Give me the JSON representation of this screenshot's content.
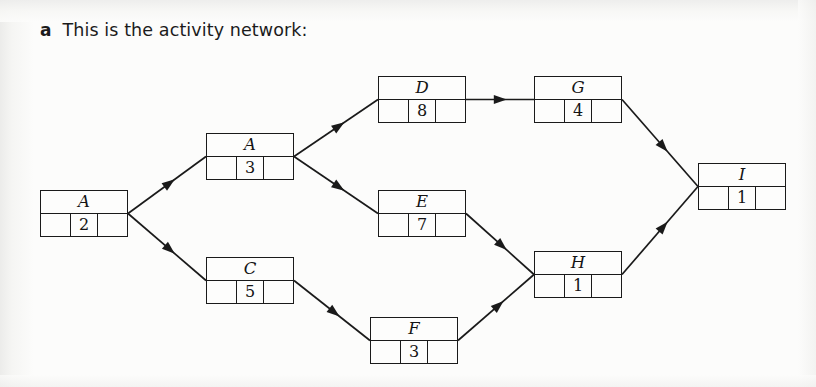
{
  "page": {
    "background_color": "#fcfcfb",
    "ink_color": "#1a1a1a"
  },
  "heading": {
    "marker": "a",
    "text": "This is the activity network:"
  },
  "diagram": {
    "type": "activity-on-node network",
    "box_layout": "top row holds activity letter; bottom row split into three cells with duration in centre cell",
    "nodes": [
      {
        "id": "a1",
        "label": "A",
        "duration": "2",
        "x": 40,
        "y": 190
      },
      {
        "id": "a2",
        "label": "A",
        "duration": "3",
        "x": 206,
        "y": 133
      },
      {
        "id": "c",
        "label": "C",
        "duration": "5",
        "x": 206,
        "y": 257
      },
      {
        "id": "d",
        "label": "D",
        "duration": "8",
        "x": 378,
        "y": 76
      },
      {
        "id": "e",
        "label": "E",
        "duration": "7",
        "x": 378,
        "y": 190
      },
      {
        "id": "f",
        "label": "F",
        "duration": "3",
        "x": 370,
        "y": 317
      },
      {
        "id": "g",
        "label": "G",
        "duration": "4",
        "x": 534,
        "y": 76
      },
      {
        "id": "h",
        "label": "H",
        "duration": "1",
        "x": 534,
        "y": 251
      },
      {
        "id": "i",
        "label": "I",
        "duration": "1",
        "x": 698,
        "y": 163
      }
    ],
    "edges": [
      {
        "from": "a1",
        "to": "a2"
      },
      {
        "from": "a1",
        "to": "c"
      },
      {
        "from": "a2",
        "to": "d"
      },
      {
        "from": "a2",
        "to": "e"
      },
      {
        "from": "c",
        "to": "f"
      },
      {
        "from": "d",
        "to": "g"
      },
      {
        "from": "e",
        "to": "h"
      },
      {
        "from": "f",
        "to": "h"
      },
      {
        "from": "g",
        "to": "i"
      },
      {
        "from": "h",
        "to": "i"
      }
    ]
  }
}
